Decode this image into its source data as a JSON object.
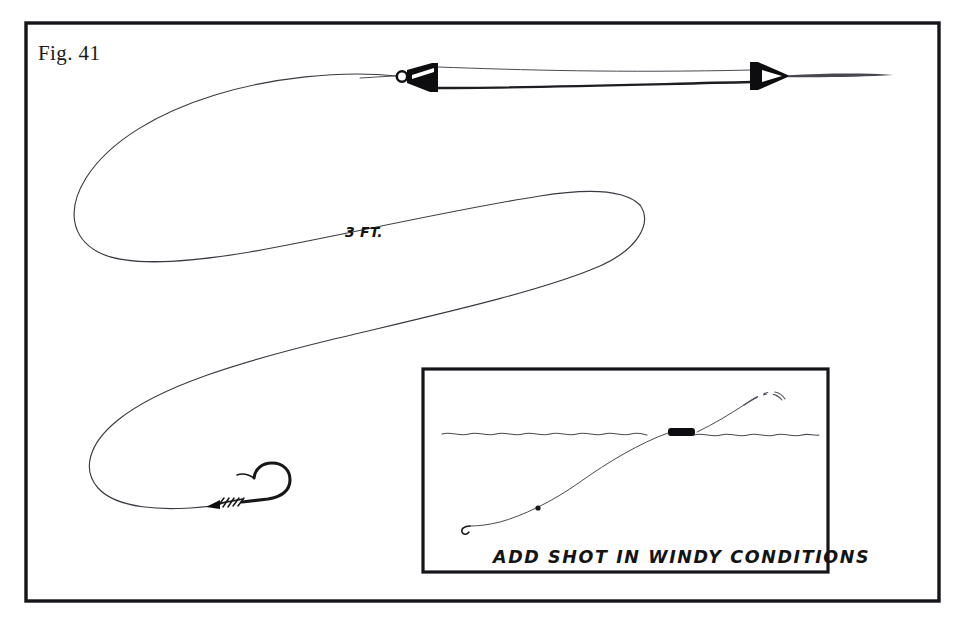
{
  "figure": {
    "label": "Fig. 41",
    "background_color": "#ffffff",
    "border_color": "#15151a",
    "ink_color": "#3a3a42"
  },
  "annotations": {
    "depth_label": "3 FT.",
    "depth_label_meaning": "three feet of line between float and hook"
  },
  "main_diagram": {
    "name": "waggler-float-rig",
    "elements": [
      {
        "name": "fishing-line",
        "description": "long S-shaped monofilament line looping from float down to hook"
      },
      {
        "name": "float-body",
        "description": "black tapered waggler float body lying horizontally"
      },
      {
        "name": "float-eye-ring",
        "description": "small circular line-eye at left end of float"
      },
      {
        "name": "float-tip-cone",
        "description": "black conical tip at right end of float"
      },
      {
        "name": "fishing-hook",
        "description": "hook with whipped knot on shank at end of line"
      },
      {
        "name": "knot-whipping",
        "description": "coil wraps of the knot on the hook shank"
      }
    ]
  },
  "inset_diagram": {
    "name": "add-shot-inset",
    "caption": "ADD SHOT IN WINDY CONDITIONS",
    "elements": [
      {
        "name": "water-surface-line",
        "description": "wavy horizontal line representing water surface"
      },
      {
        "name": "float-at-surface",
        "description": "black float lying flat on the surface"
      },
      {
        "name": "sunken-line",
        "description": "line sinking below the surface down to the hook"
      },
      {
        "name": "split-shot",
        "description": "small shot pinched on the line"
      },
      {
        "name": "inset-hook",
        "description": "small hook at the bottom end of the line"
      },
      {
        "name": "rod-line-dashed",
        "description": "dashed line running up to the right toward the rod"
      }
    ]
  },
  "colors": {
    "paper": "#ffffff",
    "ink_dark": "#15151a",
    "ink_line": "#3a3a42",
    "solid_fill": "#0d0d10"
  }
}
